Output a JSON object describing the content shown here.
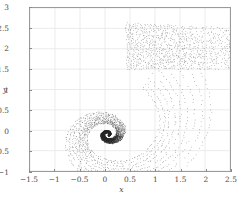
{
  "chart_data": {
    "type": "scatter",
    "title": "",
    "subtitle": "",
    "xlabel": "x",
    "ylabel": "y",
    "xlim": [
      -1.5,
      2.5
    ],
    "ylim": [
      -1,
      3
    ],
    "grid": true,
    "legend": null,
    "legend_position": "none",
    "marker": {
      "shape": "point",
      "size_px": 0.9,
      "color": "#2b2b2b",
      "opacity": 0.78
    },
    "xticks": [
      -1.5,
      -1,
      -0.5,
      0,
      0.5,
      1,
      1.5,
      2,
      2.5
    ],
    "xtick_labels": [
      "-1.5",
      "-1",
      "-0.5",
      "0",
      "0.5",
      "1",
      "1.5",
      "2",
      "2.5"
    ],
    "yticks": [
      -1,
      -0.5,
      0,
      0.5,
      1,
      1.5,
      2,
      2.5,
      3
    ],
    "ytick_labels": [
      "-1",
      "-0.5",
      "0",
      "0.5",
      "1",
      "1.5",
      "2",
      "2.5",
      "3"
    ],
    "spiral": {
      "center": [
        0.06,
        -0.1
      ],
      "arms": 9,
      "turns": 2.45,
      "a": 0.055,
      "b": 0.285,
      "theta_start": -1.2,
      "theta_end": 13.6,
      "points_per_arm": 340,
      "arm_phase_step": 0.3,
      "jitter": 0.012
    },
    "fan": {
      "rows": 26,
      "cols": 46,
      "x_range": [
        0.45,
        2.5
      ],
      "y_top_at_xmin": 2.62,
      "y_top_at_xmax": 2.5,
      "y_bot_at_xmin": 1.5,
      "y_bot_at_xmax": 1.46,
      "jitter": 0.018
    },
    "colors": {
      "point": "#2b2b2b",
      "grid": "#e8e8e8",
      "frame": "#9a9a9a",
      "tick": "#8a8a8a",
      "label": "#4d4d4d",
      "background": "#ffffff"
    }
  }
}
